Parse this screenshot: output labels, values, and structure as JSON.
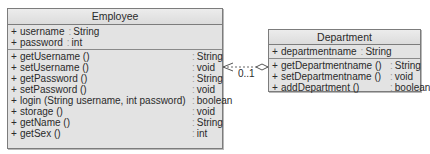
{
  "classes": {
    "employee": {
      "title": "Employee",
      "attributes": [
        {
          "visibility": "+",
          "name": "username",
          "type": "String"
        },
        {
          "visibility": "+",
          "name": "password",
          "type": "int"
        }
      ],
      "operations": [
        {
          "visibility": "+",
          "name": "getUsername ()",
          "type": "String"
        },
        {
          "visibility": "+",
          "name": "setUsername ()",
          "type": "void"
        },
        {
          "visibility": "+",
          "name": "getPassword ()",
          "type": "String"
        },
        {
          "visibility": "+",
          "name": "setPassword ()",
          "type": "void"
        },
        {
          "visibility": "+",
          "name": "login (String username, int password)",
          "type": "boolean"
        },
        {
          "visibility": "+",
          "name": "storage ()",
          "type": "void"
        },
        {
          "visibility": "+",
          "name": "getName ()",
          "type": "String"
        },
        {
          "visibility": "+",
          "name": "getSex ()",
          "type": "int"
        }
      ]
    },
    "department": {
      "title": "Department",
      "attributes": [
        {
          "visibility": "+",
          "name": "departmentname",
          "type": "String"
        }
      ],
      "operations": [
        {
          "visibility": "+",
          "name": "getDepartmentname ()",
          "type": "String"
        },
        {
          "visibility": "+",
          "name": "setDepartmentname ()",
          "type": "void"
        },
        {
          "visibility": "+",
          "name": "addDepartment ()",
          "type": "boolean"
        }
      ]
    }
  },
  "relationship": {
    "type": "aggregation",
    "from": "Department",
    "to": "Employee",
    "style": "dashed",
    "multiplicity": "0..1"
  },
  "colors": {
    "box_fill": "#e3e3e3",
    "box_border": "#7c7c7c",
    "text": "#2a2a2a"
  }
}
